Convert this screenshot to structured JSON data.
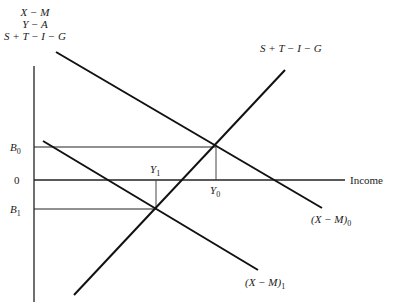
{
  "diagram": {
    "y_axis_labels": [
      "X − M",
      "Y − A",
      "S + T − I − G"
    ],
    "x_axis_label": "Income",
    "y_ticks": {
      "b0": "B",
      "b0_sub": "0",
      "zero": "0",
      "b1": "B",
      "b1_sub": "1"
    },
    "x_ticks": {
      "y1": "Y",
      "y1_sub": "1",
      "y0": "Y",
      "y0_sub": "0"
    },
    "curves": {
      "stig": {
        "label": "S + T − I − G"
      },
      "xm0": {
        "label": "(X − M)",
        "sub": "0"
      },
      "xm1": {
        "label": "(X − M)",
        "sub": "1"
      }
    },
    "colors": {
      "line": "#111111",
      "guide": "#333333",
      "background": "#ffffff"
    }
  }
}
